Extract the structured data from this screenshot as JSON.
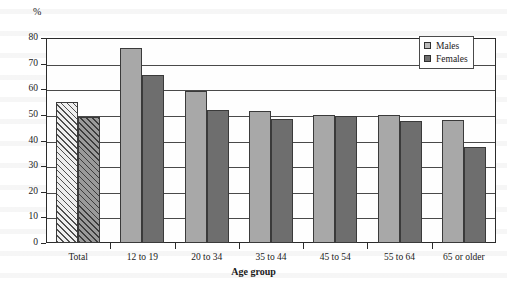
{
  "chart_data": {
    "type": "bar",
    "title": "",
    "xlabel": "Age group",
    "ylabel": "%",
    "ylim": [
      0,
      80
    ],
    "yticks": [
      0,
      10,
      20,
      30,
      40,
      50,
      60,
      70,
      80
    ],
    "grid": true,
    "legend_position": "top-right",
    "categories": [
      "Total",
      "12 to 19",
      "20 to 34",
      "35 to 44",
      "45 to 54",
      "55 to 64",
      "65 or older"
    ],
    "series": [
      {
        "name": "Males",
        "color": "#a8a8a8",
        "values": [
          55,
          76,
          59.5,
          51.5,
          50,
          50,
          48
        ]
      },
      {
        "name": "Females",
        "color": "#6e6e6e",
        "values": [
          49,
          65.5,
          52,
          48.5,
          49.5,
          47.5,
          37.5
        ]
      }
    ]
  },
  "axes": {
    "y_unit_label": "%",
    "x_axis_title": "Age group"
  },
  "legend": {
    "entries": [
      {
        "label": "Males",
        "swatch": "males"
      },
      {
        "label": "Females",
        "swatch": "females"
      }
    ]
  }
}
